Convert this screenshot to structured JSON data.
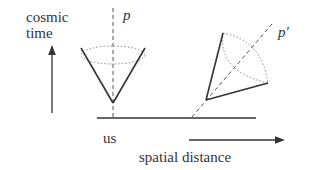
{
  "labels": {
    "y_axis_line1": "cosmic",
    "y_axis_line2": "time",
    "cone_left": "p",
    "cone_right": "p'",
    "origin": "us",
    "x_axis": "spatial distance"
  },
  "colors": {
    "stroke": "#333333",
    "dashed": "#555555",
    "dotted": "#888888"
  }
}
